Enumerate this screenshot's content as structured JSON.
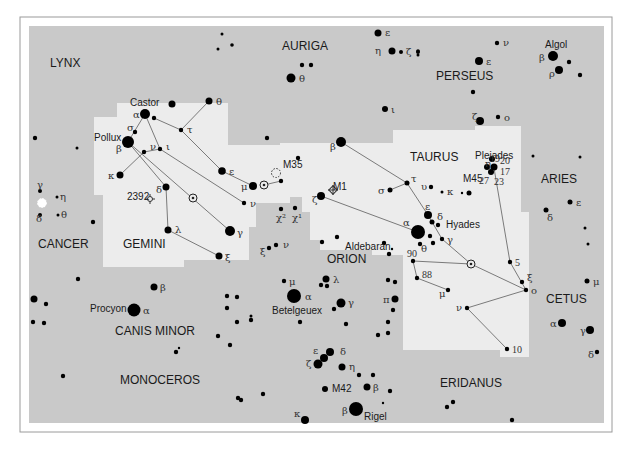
{
  "chart": {
    "colors": {
      "sky": "#c9c9c9",
      "region": "#ececec",
      "star": "#000000",
      "line": "#7a7a7a"
    },
    "constellations": [
      {
        "id": "lynx",
        "label": "LYNX",
        "x": 50,
        "y": 67
      },
      {
        "id": "auriga",
        "label": "AURIGA",
        "x": 282,
        "y": 50
      },
      {
        "id": "perseus",
        "label": "PERSEUS",
        "x": 436,
        "y": 80
      },
      {
        "id": "taurus",
        "label": "TAURUS",
        "x": 410,
        "y": 161
      },
      {
        "id": "aries",
        "label": "ARIES",
        "x": 541,
        "y": 183
      },
      {
        "id": "cancer",
        "label": "CANCER",
        "x": 38,
        "y": 248
      },
      {
        "id": "gemini",
        "label": "GEMINI",
        "x": 123,
        "y": 248
      },
      {
        "id": "orion",
        "label": "ORION",
        "x": 327,
        "y": 263
      },
      {
        "id": "cetus",
        "label": "CETUS",
        "x": 546,
        "y": 303
      },
      {
        "id": "canis-minor",
        "label": "CANIS MINOR",
        "x": 115,
        "y": 335
      },
      {
        "id": "monoceros",
        "label": "MONOCEROS",
        "x": 120,
        "y": 384
      },
      {
        "id": "eridanus",
        "label": "ERIDANUS",
        "x": 440,
        "y": 387
      }
    ],
    "names": [
      {
        "label": "Castor",
        "x": 130,
        "y": 106
      },
      {
        "label": "Pollux",
        "x": 94,
        "y": 141
      },
      {
        "label": "Algol",
        "x": 545,
        "y": 48
      },
      {
        "label": "Pleiades",
        "x": 475,
        "y": 159
      },
      {
        "label": "Hyades",
        "x": 446,
        "y": 228
      },
      {
        "label": "Aldebaran",
        "x": 345,
        "y": 250
      },
      {
        "label": "Betelgeuex",
        "x": 272,
        "y": 314
      },
      {
        "label": "Procyon",
        "x": 90,
        "y": 312
      },
      {
        "label": "Rigel",
        "x": 364,
        "y": 420
      },
      {
        "label": "M35",
        "x": 283,
        "y": 168
      },
      {
        "label": "M1",
        "x": 333,
        "y": 190
      },
      {
        "label": "M42",
        "x": 332,
        "y": 392
      },
      {
        "label": "M45",
        "x": 463,
        "y": 182
      },
      {
        "label": "2392",
        "x": 127,
        "y": 200
      }
    ],
    "stars": [
      {
        "x": 378,
        "y": 33,
        "r": 3.5,
        "l": "ε",
        "lx": 385,
        "ly": 36
      },
      {
        "x": 392,
        "y": 51,
        "r": 3.5,
        "l": "η",
        "lx": 375,
        "ly": 54
      },
      {
        "x": 401,
        "y": 52,
        "r": 2,
        "l": "ζ",
        "lx": 406,
        "ly": 55
      },
      {
        "x": 418,
        "y": 52,
        "r": 2
      },
      {
        "x": 222,
        "y": 34,
        "r": 1.5
      },
      {
        "x": 218,
        "y": 49,
        "r": 1.5
      },
      {
        "x": 232,
        "y": 45,
        "r": 1.8
      },
      {
        "x": 302,
        "y": 65,
        "r": 2.2
      },
      {
        "x": 311,
        "y": 65,
        "r": 2.2
      },
      {
        "x": 291,
        "y": 78,
        "r": 4.5,
        "l": "θ",
        "lx": 299,
        "ly": 82
      },
      {
        "x": 385,
        "y": 109,
        "r": 3,
        "l": "ι",
        "lx": 391,
        "ly": 113
      },
      {
        "x": 418,
        "y": 51,
        "r": 1.8
      },
      {
        "x": 497,
        "y": 43,
        "r": 2.2,
        "l": "ν",
        "lx": 503,
        "ly": 46
      },
      {
        "x": 479,
        "y": 61,
        "r": 4,
        "l": "ε",
        "lx": 486,
        "ly": 65
      },
      {
        "x": 553,
        "y": 56,
        "r": 5,
        "l": "β",
        "lx": 539,
        "ly": 61
      },
      {
        "x": 569,
        "y": 62,
        "r": 2.2
      },
      {
        "x": 559,
        "y": 70,
        "r": 4,
        "l": "ρ",
        "lx": 549,
        "ly": 77
      },
      {
        "x": 580,
        "y": 75,
        "r": 2.2
      },
      {
        "x": 473,
        "y": 92,
        "r": 2.2
      },
      {
        "x": 418,
        "y": 55,
        "r": 1.5
      },
      {
        "x": 480,
        "y": 121,
        "r": 4,
        "l": "ζ",
        "lx": 472,
        "ly": 120
      },
      {
        "x": 498,
        "y": 117,
        "r": 2.2,
        "l": "ο",
        "lx": 504,
        "ly": 121
      },
      {
        "x": 145,
        "y": 114,
        "r": 5,
        "l": "α",
        "lx": 133,
        "ly": 118
      },
      {
        "x": 154,
        "y": 118,
        "r": 2.2
      },
      {
        "x": 128,
        "y": 142,
        "r": 6,
        "l": "β",
        "lx": 116,
        "ly": 152
      },
      {
        "x": 135,
        "y": 132,
        "r": 2.2,
        "l": "σ",
        "lx": 127,
        "ly": 131
      },
      {
        "x": 144,
        "y": 152,
        "r": 2.2,
        "l": "ν",
        "lx": 150,
        "ly": 150
      },
      {
        "x": 160,
        "y": 149,
        "r": 2.2,
        "l": "ι",
        "lx": 166,
        "ly": 150
      },
      {
        "x": 181,
        "y": 130,
        "r": 2.2,
        "l": "τ",
        "lx": 187,
        "ly": 133
      },
      {
        "x": 209,
        "y": 101,
        "r": 3.5,
        "l": "θ",
        "lx": 216,
        "ly": 105
      },
      {
        "x": 120,
        "y": 175,
        "r": 3.5,
        "l": "κ",
        "lx": 108,
        "ly": 179
      },
      {
        "x": 222,
        "y": 171,
        "r": 3.8,
        "l": "ε",
        "lx": 229,
        "ly": 175
      },
      {
        "x": 166,
        "y": 187,
        "r": 3.5,
        "l": "δ",
        "lx": 156,
        "ly": 193
      },
      {
        "x": 168,
        "y": 230,
        "r": 3.5,
        "l": "λ",
        "lx": 175,
        "ly": 233
      },
      {
        "x": 230,
        "y": 231,
        "r": 5,
        "l": "γ",
        "lx": 237,
        "ly": 236
      },
      {
        "x": 244,
        "y": 203,
        "r": 2.2,
        "l": "ν",
        "lx": 250,
        "ly": 207
      },
      {
        "x": 253,
        "y": 186,
        "r": 4,
        "l": "μ",
        "lx": 241,
        "ly": 190
      },
      {
        "x": 281,
        "y": 181,
        "r": 2.2
      },
      {
        "x": 219,
        "y": 256,
        "r": 3.5,
        "l": "ξ",
        "lx": 225,
        "ly": 261
      },
      {
        "x": 298,
        "y": 158,
        "r": 2.2
      },
      {
        "x": 281,
        "y": 209,
        "r": 2.2,
        "l": "χ²",
        "lx": 276,
        "ly": 221
      },
      {
        "x": 295,
        "y": 208,
        "r": 2.2,
        "l": "χ¹",
        "lx": 292,
        "ly": 221
      },
      {
        "x": 269,
        "y": 248,
        "r": 2.2,
        "l": "ξ",
        "lx": 260,
        "ly": 255
      },
      {
        "x": 276,
        "y": 245,
        "r": 2.2,
        "l": "ν",
        "lx": 283,
        "ly": 248
      },
      {
        "x": 341,
        "y": 142,
        "r": 5,
        "l": "β",
        "lx": 330,
        "ly": 150
      },
      {
        "x": 321,
        "y": 196,
        "r": 4,
        "l": "ζ",
        "lx": 312,
        "ly": 203
      },
      {
        "x": 407,
        "y": 183,
        "r": 2.5,
        "l": "τ",
        "lx": 411,
        "ly": 182
      },
      {
        "x": 390,
        "y": 190,
        "r": 2.5,
        "l": "σ",
        "lx": 378,
        "ly": 194
      },
      {
        "x": 431,
        "y": 187,
        "r": 2.2,
        "l": "υ",
        "lx": 421,
        "ly": 190
      },
      {
        "x": 442,
        "y": 192,
        "r": 1.5,
        "l": "κ",
        "lx": 447,
        "ly": 195
      },
      {
        "x": 469,
        "y": 193,
        "r": 2.5
      },
      {
        "x": 462,
        "y": 193,
        "r": 1.2
      },
      {
        "x": 428,
        "y": 215,
        "r": 4,
        "l": "ε",
        "lx": 425,
        "ly": 210
      },
      {
        "x": 432,
        "y": 222,
        "r": 2.5,
        "l": "δ",
        "lx": 437,
        "ly": 220
      },
      {
        "x": 438,
        "y": 225,
        "r": 2.2
      },
      {
        "x": 418,
        "y": 232,
        "r": 7,
        "l": "α",
        "lx": 403,
        "ly": 226
      },
      {
        "x": 420,
        "y": 244,
        "r": 2.2,
        "l": "θ",
        "lx": 421,
        "ly": 252
      },
      {
        "x": 433,
        "y": 243,
        "r": 2.2
      },
      {
        "x": 430,
        "y": 236,
        "r": 2.2
      },
      {
        "x": 442,
        "y": 239,
        "r": 2.2,
        "l": "γ",
        "lx": 447,
        "ly": 243
      },
      {
        "x": 413,
        "y": 261,
        "r": 2.2,
        "l": "90",
        "lx": 407,
        "ly": 257,
        "n": true
      },
      {
        "x": 417,
        "y": 278,
        "r": 2.2,
        "l": "88",
        "lx": 422,
        "ly": 278,
        "n": true
      },
      {
        "x": 448,
        "y": 290,
        "r": 2.2,
        "l": "μ",
        "lx": 439,
        "ly": 297
      },
      {
        "x": 467,
        "y": 308,
        "r": 2.2,
        "l": "ν",
        "lx": 456,
        "ly": 311
      },
      {
        "x": 510,
        "y": 262,
        "r": 2.2,
        "l": "5",
        "lx": 515,
        "ly": 266,
        "n": true
      },
      {
        "x": 522,
        "y": 282,
        "r": 2.2,
        "l": "ξ",
        "lx": 527,
        "ly": 281
      },
      {
        "x": 526,
        "y": 290,
        "r": 2.2,
        "l": "ο",
        "lx": 531,
        "ly": 294
      },
      {
        "x": 507,
        "y": 349,
        "r": 2.2,
        "l": "10",
        "lx": 512,
        "ly": 353,
        "n": true
      },
      {
        "x": 492,
        "y": 159,
        "r": 3
      },
      {
        "x": 487,
        "y": 167,
        "r": 3
      },
      {
        "x": 494,
        "y": 167,
        "r": 3.5
      },
      {
        "x": 491,
        "y": 172,
        "r": 3
      },
      {
        "x": 533,
        "y": 156,
        "r": 1.5
      },
      {
        "x": 580,
        "y": 157,
        "r": 1.5
      },
      {
        "x": 570,
        "y": 202,
        "r": 2.5,
        "l": "ε",
        "lx": 576,
        "ly": 206
      },
      {
        "x": 546,
        "y": 210,
        "r": 2.5,
        "l": "δ",
        "lx": 547,
        "ly": 221
      },
      {
        "x": 585,
        "y": 228,
        "r": 1.5
      },
      {
        "x": 588,
        "y": 244,
        "r": 1.5
      },
      {
        "x": 587,
        "y": 281,
        "r": 2.5,
        "l": "μ",
        "lx": 593,
        "ly": 285
      },
      {
        "x": 562,
        "y": 323,
        "r": 4,
        "l": "α",
        "lx": 550,
        "ly": 327
      },
      {
        "x": 590,
        "y": 330,
        "r": 4,
        "l": "γ",
        "lx": 580,
        "ly": 334
      },
      {
        "x": 597,
        "y": 352,
        "r": 2.2,
        "l": "δ",
        "lx": 588,
        "ly": 358
      },
      {
        "x": 40,
        "y": 191,
        "r": 2,
        "l": "γ",
        "lx": 37,
        "ly": 188
      },
      {
        "x": 57,
        "y": 197,
        "r": 1.5,
        "l": "η",
        "lx": 60,
        "ly": 200
      },
      {
        "x": 40,
        "y": 215,
        "r": 2,
        "l": "δ",
        "lx": 36,
        "ly": 222
      },
      {
        "x": 58,
        "y": 215,
        "r": 1.5,
        "l": "θ",
        "lx": 61,
        "ly": 218
      },
      {
        "x": 93,
        "y": 222,
        "r": 2.2
      },
      {
        "x": 35,
        "y": 138,
        "r": 2.2
      },
      {
        "x": 77,
        "y": 148,
        "r": 1.5
      },
      {
        "x": 172,
        "y": 104,
        "r": 3.5
      },
      {
        "x": 267,
        "y": 138,
        "r": 2.2
      },
      {
        "x": 322,
        "y": 242,
        "r": 2.2
      },
      {
        "x": 337,
        "y": 237,
        "r": 2.2
      },
      {
        "x": 384,
        "y": 243,
        "r": 2.2
      },
      {
        "x": 389,
        "y": 254,
        "r": 2.2
      },
      {
        "x": 392,
        "y": 249,
        "r": 1.2
      },
      {
        "x": 78,
        "y": 279,
        "r": 2.2
      },
      {
        "x": 154,
        "y": 287,
        "r": 3.5,
        "l": "β",
        "lx": 160,
        "ly": 291
      },
      {
        "x": 134,
        "y": 310,
        "r": 6.5,
        "l": "α",
        "lx": 143,
        "ly": 314
      },
      {
        "x": 34,
        "y": 299,
        "r": 3.5
      },
      {
        "x": 46,
        "y": 304,
        "r": 2.2
      },
      {
        "x": 33,
        "y": 322,
        "r": 2.2
      },
      {
        "x": 44,
        "y": 323,
        "r": 2.2
      },
      {
        "x": 227,
        "y": 296,
        "r": 2.2
      },
      {
        "x": 237,
        "y": 297,
        "r": 2.2
      },
      {
        "x": 218,
        "y": 336,
        "r": 2.2
      },
      {
        "x": 176,
        "y": 352,
        "r": 2.2
      },
      {
        "x": 179,
        "y": 348,
        "r": 1.2
      },
      {
        "x": 63,
        "y": 376,
        "r": 2.2
      },
      {
        "x": 238,
        "y": 398,
        "r": 2.2
      },
      {
        "x": 227,
        "y": 308,
        "r": 2.2
      },
      {
        "x": 237,
        "y": 322,
        "r": 2.2
      },
      {
        "x": 251,
        "y": 320,
        "r": 2.2
      },
      {
        "x": 230,
        "y": 345,
        "r": 2.2
      },
      {
        "x": 284,
        "y": 281,
        "r": 2.2,
        "l": "μ",
        "lx": 289,
        "ly": 285
      },
      {
        "x": 294,
        "y": 296,
        "r": 7,
        "l": "α",
        "lx": 305,
        "ly": 300
      },
      {
        "x": 326,
        "y": 279,
        "r": 3.5,
        "l": "λ",
        "lx": 333,
        "ly": 283
      },
      {
        "x": 321,
        "y": 285,
        "r": 2.2
      },
      {
        "x": 327,
        "y": 286,
        "r": 2.2
      },
      {
        "x": 341,
        "y": 303,
        "r": 4.5,
        "l": "γ",
        "lx": 348,
        "ly": 306
      },
      {
        "x": 334,
        "y": 309,
        "r": 2.2
      },
      {
        "x": 251,
        "y": 316,
        "r": 1.5
      },
      {
        "x": 300,
        "y": 322,
        "r": 2.2
      },
      {
        "x": 346,
        "y": 324,
        "r": 2.2
      },
      {
        "x": 378,
        "y": 335,
        "r": 2.2
      },
      {
        "x": 388,
        "y": 333,
        "r": 2.2
      },
      {
        "x": 388,
        "y": 280,
        "r": 2.2
      },
      {
        "x": 395,
        "y": 282,
        "r": 2.2
      },
      {
        "x": 395,
        "y": 299,
        "r": 3.5,
        "l": "π",
        "lx": 383,
        "ly": 303
      },
      {
        "x": 393,
        "y": 310,
        "r": 2.2
      },
      {
        "x": 388,
        "y": 322,
        "r": 2.2
      },
      {
        "x": 330,
        "y": 352,
        "r": 4,
        "l": "δ",
        "lx": 340,
        "ly": 355
      },
      {
        "x": 324,
        "y": 358,
        "r": 4,
        "l": "ε",
        "lx": 313,
        "ly": 354
      },
      {
        "x": 318,
        "y": 364,
        "r": 4.5,
        "l": "ζ",
        "lx": 306,
        "ly": 367
      },
      {
        "x": 342,
        "y": 367,
        "r": 3.5,
        "l": "η",
        "lx": 349,
        "ly": 370
      },
      {
        "x": 325,
        "y": 389,
        "r": 3,
        "l": "",
        "lx": 0,
        "ly": 0
      },
      {
        "x": 367,
        "y": 387,
        "r": 3.5,
        "l": "β",
        "lx": 373,
        "ly": 391
      },
      {
        "x": 359,
        "y": 375,
        "r": 2.2
      },
      {
        "x": 373,
        "y": 375,
        "r": 2.2
      },
      {
        "x": 390,
        "y": 391,
        "r": 2.2
      },
      {
        "x": 383,
        "y": 403,
        "r": 1.2
      },
      {
        "x": 356,
        "y": 409,
        "r": 7,
        "l": "β",
        "lx": 342,
        "ly": 414
      },
      {
        "x": 305,
        "y": 420,
        "r": 4,
        "l": "κ",
        "lx": 294,
        "ly": 417
      },
      {
        "x": 241,
        "y": 400,
        "r": 2.2
      },
      {
        "x": 263,
        "y": 394,
        "r": 2.2
      },
      {
        "x": 447,
        "y": 407,
        "r": 2.2
      },
      {
        "x": 453,
        "y": 402,
        "r": 2.2
      },
      {
        "x": 512,
        "y": 420,
        "r": 2.2
      }
    ],
    "lines": [
      [
        145,
        114,
        128,
        142
      ],
      [
        145,
        114,
        160,
        149
      ],
      [
        154,
        118,
        181,
        130
      ],
      [
        181,
        130,
        209,
        101
      ],
      [
        181,
        130,
        222,
        171
      ],
      [
        222,
        171,
        253,
        186
      ],
      [
        160,
        149,
        244,
        203
      ],
      [
        144,
        152,
        120,
        175
      ],
      [
        160,
        149,
        144,
        152
      ],
      [
        128,
        142,
        166,
        187
      ],
      [
        128,
        142,
        230,
        231
      ],
      [
        166,
        187,
        168,
        230
      ],
      [
        168,
        230,
        219,
        256
      ],
      [
        281,
        181,
        264,
        185
      ],
      [
        341,
        142,
        407,
        183
      ],
      [
        407,
        183,
        390,
        190
      ],
      [
        407,
        183,
        428,
        215
      ],
      [
        428,
        215,
        442,
        239
      ],
      [
        442,
        239,
        471,
        264
      ],
      [
        471,
        264,
        526,
        290
      ],
      [
        413,
        261,
        471,
        264
      ],
      [
        413,
        261,
        417,
        278
      ],
      [
        417,
        278,
        448,
        290
      ],
      [
        526,
        290,
        467,
        308
      ],
      [
        467,
        308,
        507,
        349
      ],
      [
        526,
        290,
        510,
        262
      ],
      [
        510,
        262,
        494,
        168
      ],
      [
        321,
        196,
        418,
        232
      ]
    ],
    "objects": [
      {
        "type": "open-cluster",
        "name": "m35",
        "x": 276,
        "y": 173
      },
      {
        "type": "planetary",
        "name": "ngc2392",
        "x": 150,
        "y": 199
      },
      {
        "type": "nebula-cross",
        "name": "m1",
        "x": 333,
        "y": 190
      },
      {
        "type": "target",
        "name": "eta-gem",
        "x": 264,
        "y": 185
      },
      {
        "type": "target",
        "name": "zeta-gem",
        "x": 193,
        "y": 198
      },
      {
        "type": "target",
        "name": "lambda-tau",
        "x": 471,
        "y": 264
      },
      {
        "type": "open-cluster-bright",
        "name": "m44",
        "x": 42,
        "y": 203
      }
    ]
  }
}
